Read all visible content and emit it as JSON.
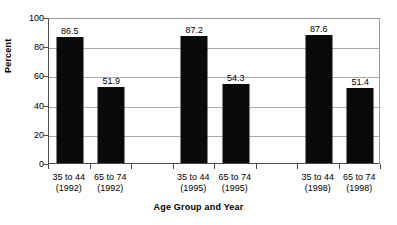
{
  "chart_data": {
    "type": "bar",
    "title": "",
    "xlabel": "Age Group and Year",
    "ylabel": "Percent",
    "ylim": [
      0,
      100
    ],
    "yticks": [
      0,
      20,
      40,
      60,
      80,
      100
    ],
    "grid": true,
    "legend": false,
    "categories": [
      "35 to 44 (1992)",
      "65 to 74 (1992)",
      "",
      "35 to 44 (1995)",
      "65 to 74 (1995)",
      "",
      "35 to 44 (1998)",
      "65 to 74 (1998)"
    ],
    "values": [
      86.5,
      51.9,
      null,
      87.2,
      54.3,
      null,
      87.6,
      51.4
    ],
    "bar_color": "#0a0a0a",
    "bars": [
      {
        "age_group": "35 to 44",
        "year": "(1992)",
        "value": 86.5,
        "value_label": "86.5"
      },
      {
        "age_group": "65 to 74",
        "year": "(1992)",
        "value": 51.9,
        "value_label": "51.9"
      },
      {
        "age_group": "",
        "year": "",
        "value": null,
        "value_label": ""
      },
      {
        "age_group": "35 to 44",
        "year": "(1995)",
        "value": 87.2,
        "value_label": "87.2"
      },
      {
        "age_group": "65 to 74",
        "year": "(1995)",
        "value": 54.3,
        "value_label": "54.3"
      },
      {
        "age_group": "",
        "year": "",
        "value": null,
        "value_label": ""
      },
      {
        "age_group": "35 to 44",
        "year": "(1998)",
        "value": 87.6,
        "value_label": "87.6"
      },
      {
        "age_group": "65 to 74",
        "year": "(1998)",
        "value": 51.4,
        "value_label": "51.4"
      }
    ],
    "ytick_labels": [
      "0",
      "20",
      "40",
      "60",
      "80",
      "100"
    ]
  }
}
